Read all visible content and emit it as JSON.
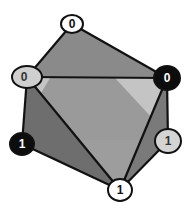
{
  "diagram": {
    "type": "octahedron-vertex-labeling",
    "vertices": [
      {
        "id": "top",
        "label": "0",
        "cx": 72,
        "cy": 24,
        "rx": 11,
        "ry": 9,
        "fill": "#ffffff",
        "text": "#111111"
      },
      {
        "id": "upper-left",
        "label": "0",
        "cx": 27,
        "cy": 77,
        "rx": 15,
        "ry": 11,
        "fill": "#cfcfcf",
        "text": "#333333"
      },
      {
        "id": "upper-right",
        "label": "0",
        "cx": 167,
        "cy": 78,
        "rx": 13,
        "ry": 12,
        "fill": "#0d0d0d",
        "text": "#ffffff"
      },
      {
        "id": "lower-left",
        "label": "1",
        "cx": 22,
        "cy": 144,
        "rx": 12,
        "ry": 11,
        "fill": "#0d0d0d",
        "text": "#ffffff"
      },
      {
        "id": "lower-right",
        "label": "1",
        "cx": 168,
        "cy": 141,
        "rx": 13,
        "ry": 12,
        "fill": "#d4d4d4",
        "text": "#333333"
      },
      {
        "id": "bottom",
        "label": "1",
        "cx": 120,
        "cy": 190,
        "rx": 12,
        "ry": 11,
        "fill": "#ffffff",
        "text": "#111111"
      }
    ],
    "colors": {
      "edge": "#111111",
      "face_top": "#8a8a8a",
      "face_center": "#9a9a9a",
      "face_light": "#c4c4c4",
      "face_left": "#6e6e6e",
      "face_left_dark": "#5a5a5a",
      "face_right": "#7a7a7a"
    }
  }
}
